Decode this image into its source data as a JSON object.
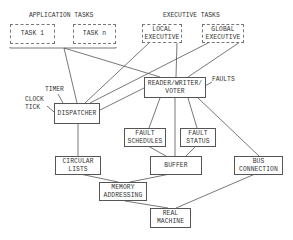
{
  "diagram": {
    "groups": {
      "application_tasks": "APPLICATION TASKS",
      "executive_tasks": "EXECUTIVE TASKS"
    },
    "nodes": {
      "task1": "TASK 1",
      "taskn": "TASK n",
      "local_exec": "LOCAL\nEXECUTIVE",
      "global_exec": "GLOBAL\nEXECUTIVE",
      "rwv": "READER/WRITER/\nVOTER",
      "dispatcher": "DISPATCHER",
      "fault_schedules": "FAULT\nSCHEDULES",
      "fault_status": "FAULT\nSTATUS",
      "circular_lists": "CIRCULAR\nLISTS",
      "buffer": "BUFFER",
      "bus_connection": "BUS\nCONNECTION",
      "memory_addressing": "MEMORY\nADDRESSING",
      "real_machine": "REAL\nMACHINE"
    },
    "labels": {
      "timer": "TIMER",
      "clock_tick": "CLOCK\nTICK",
      "faults": "FAULTS"
    },
    "edges": [
      [
        "application_tasks",
        "dispatcher"
      ],
      [
        "application_tasks",
        "rwv"
      ],
      [
        "local_exec",
        "dispatcher"
      ],
      [
        "local_exec",
        "rwv"
      ],
      [
        "global_exec",
        "dispatcher"
      ],
      [
        "global_exec",
        "rwv"
      ],
      [
        "rwv",
        "dispatcher"
      ],
      [
        "timer",
        "dispatcher"
      ],
      [
        "clock_tick",
        "dispatcher"
      ],
      [
        "faults",
        "rwv"
      ],
      [
        "rwv",
        "fault_schedules"
      ],
      [
        "rwv",
        "fault_status"
      ],
      [
        "rwv",
        "buffer"
      ],
      [
        "rwv",
        "bus_connection"
      ],
      [
        "dispatcher",
        "circular_lists"
      ],
      [
        "fault_schedules",
        "buffer"
      ],
      [
        "fault_status",
        "buffer"
      ],
      [
        "circular_lists",
        "memory_addressing"
      ],
      [
        "buffer",
        "memory_addressing"
      ],
      [
        "memory_addressing",
        "real_machine"
      ],
      [
        "bus_connection",
        "real_machine"
      ]
    ]
  }
}
